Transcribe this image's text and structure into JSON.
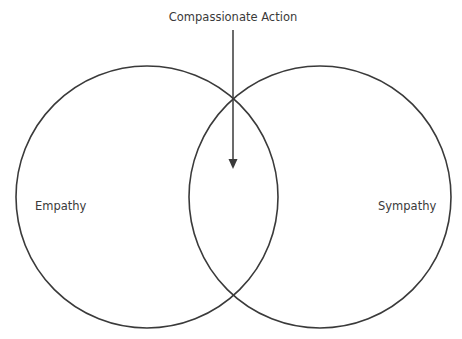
{
  "diagram": {
    "type": "venn",
    "circles": [
      {
        "label": "Empathy",
        "cx": 147,
        "cy": 197,
        "r": 131
      },
      {
        "label": "Sympathy",
        "cx": 320,
        "cy": 197,
        "r": 131
      }
    ],
    "arrow": {
      "label": "Compassionate Action",
      "x": 233,
      "y1": 30,
      "y2": 168
    },
    "colors": {
      "stroke": "#3a3a3a",
      "background": "#ffffff"
    }
  }
}
